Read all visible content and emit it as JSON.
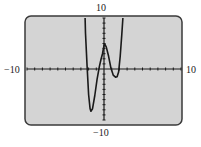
{
  "chart_data": {
    "type": "line",
    "title": "",
    "xlabel": "",
    "ylabel": "",
    "xlim": [
      -10,
      10
    ],
    "ylim": [
      -10,
      10
    ],
    "grid": false,
    "legend": null,
    "tick_labels": {
      "xmin": "−10",
      "xmax": "10",
      "ymin": "−10",
      "ymax": "10"
    },
    "tick_spacing": 1,
    "series": [
      {
        "name": "y",
        "x": [
          -2.45,
          -2.4,
          -2.2,
          -2.0,
          -1.8,
          -1.7,
          -1.5,
          -1.2,
          -0.9,
          -0.6,
          -0.4,
          -0.2,
          0.0,
          0.1,
          0.3,
          0.6,
          0.9,
          1.2,
          1.5,
          1.7,
          1.9,
          2.1,
          2.3,
          2.45
        ],
        "y": [
          10,
          7.0,
          0.5,
          -5.0,
          -7.8,
          -8.3,
          -7.8,
          -5.2,
          -2.0,
          0.5,
          1.8,
          3.0,
          4.6,
          4.9,
          4.3,
          2.5,
          0.2,
          -1.2,
          -1.6,
          -1.5,
          -0.6,
          2.5,
          6.5,
          10
        ]
      }
    ],
    "colors": {
      "screen_background": "#d4d4d4",
      "screen_border": "#3a3a3a",
      "curve": "#1a1a1a",
      "axes": "#1a1a1a"
    }
  }
}
